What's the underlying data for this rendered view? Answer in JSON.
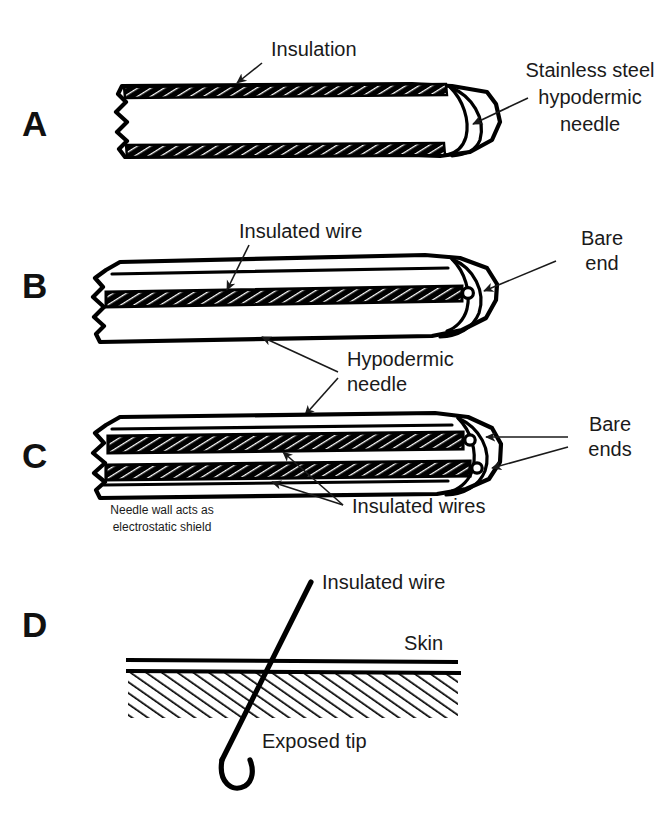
{
  "figure": {
    "background_color": "#ffffff",
    "ink_color": "#000000",
    "width": 657,
    "height": 815
  },
  "panels": [
    {
      "letter": "A",
      "name": "insulated-hypodermic-needle",
      "labels": [
        {
          "key": "insulation",
          "text": "Insulation"
        },
        {
          "key": "needle_l1",
          "text": "Stainless steel"
        },
        {
          "key": "needle_l2",
          "text": "hypodermic"
        },
        {
          "key": "needle_l3",
          "text": "needle"
        }
      ]
    },
    {
      "letter": "B",
      "name": "single-wire-needle-electrode",
      "labels": [
        {
          "key": "insulated_wire",
          "text": "Insulated wire"
        },
        {
          "key": "bare_end_l1",
          "text": "Bare"
        },
        {
          "key": "bare_end_l2",
          "text": "end"
        }
      ]
    },
    {
      "letter": "C",
      "name": "dual-wire-needle-electrode",
      "labels": [
        {
          "key": "hypodermic_l1",
          "text": "Hypodermic"
        },
        {
          "key": "hypodermic_l2",
          "text": "needle"
        },
        {
          "key": "bare_ends_l1",
          "text": "Bare"
        },
        {
          "key": "bare_ends_l2",
          "text": "ends"
        },
        {
          "key": "insulated_wires",
          "text": "Insulated wires"
        },
        {
          "key": "shield_l1",
          "text": "Needle wall acts as"
        },
        {
          "key": "shield_l2",
          "text": "electrostatic shield"
        }
      ]
    },
    {
      "letter": "D",
      "name": "fine-wire-electrode-in-skin",
      "labels": [
        {
          "key": "insulated_wire",
          "text": "Insulated wire"
        },
        {
          "key": "skin",
          "text": "Skin"
        },
        {
          "key": "exposed_tip",
          "text": "Exposed tip"
        }
      ]
    }
  ],
  "letters": {
    "a": "A",
    "b": "B",
    "c": "C",
    "d": "D"
  },
  "text": {
    "insulation": "Insulation",
    "stainless_steel": "Stainless steel",
    "hypodermic": "hypodermic",
    "needle": "needle",
    "insulated_wire": "Insulated wire",
    "bare": "Bare",
    "end": "end",
    "hypodermic_word": "Hypodermic",
    "needle_word": "needle",
    "bare_ends_1": "Bare",
    "bare_ends_2": "ends",
    "insulated_wires": "Insulated wires",
    "shield_line1": "Needle wall acts as",
    "shield_line2": "electrostatic shield",
    "insulated_wire_d": "Insulated wire",
    "skin": "Skin",
    "exposed_tip": "Exposed tip"
  }
}
